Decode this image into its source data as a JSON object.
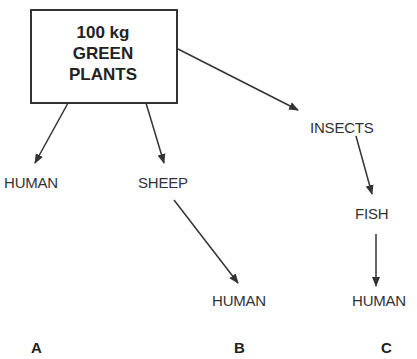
{
  "diagram": {
    "source_box": {
      "line1": "100 kg",
      "line2": "GREEN",
      "line3": "PLANTS"
    },
    "nodes": {
      "human_a": "HUMAN",
      "sheep": "SHEEP",
      "insects": "INSECTS",
      "human_b": "HUMAN",
      "fish": "FISH",
      "human_c": "HUMAN"
    },
    "chain_labels": {
      "a": "A",
      "b": "B",
      "c": "C"
    },
    "edges": [
      {
        "from": "100 kg GREEN PLANTS",
        "to": "HUMAN (A)"
      },
      {
        "from": "100 kg GREEN PLANTS",
        "to": "SHEEP"
      },
      {
        "from": "SHEEP",
        "to": "HUMAN (B)"
      },
      {
        "from": "100 kg GREEN PLANTS",
        "to": "INSECTS"
      },
      {
        "from": "INSECTS",
        "to": "FISH"
      },
      {
        "from": "FISH",
        "to": "HUMAN (C)"
      }
    ]
  }
}
